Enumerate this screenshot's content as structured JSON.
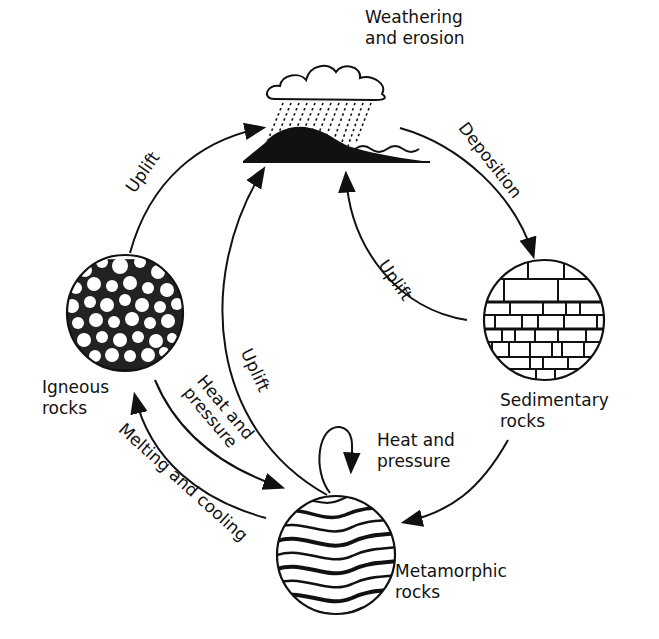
{
  "colors": {
    "ink": "#111111",
    "background": "#ffffff"
  },
  "nodes": {
    "weathering": {
      "line1": "Weathering",
      "line2": "and erosion"
    },
    "igneous": {
      "line1": "Igneous",
      "line2": "rocks"
    },
    "sedimentary": {
      "line1": "Sedimentary",
      "line2": "rocks"
    },
    "metamorphic": {
      "line1": "Metamorphic",
      "line2": "rocks"
    }
  },
  "processes": {
    "uplift_igneous": "Uplift",
    "deposition": "Deposition",
    "uplift_sedimentary": "Uplift",
    "uplift_metamorphic": "Uplift",
    "heat_pressure_igneous": {
      "line1": "Heat and",
      "line2": "pressure"
    },
    "heat_pressure_self": {
      "line1": "Heat and",
      "line2": "pressure"
    },
    "melting_cooling": "Melting and cooling"
  },
  "edges": [
    {
      "from": "Igneous rocks",
      "to": "Weathering and erosion",
      "label": "Uplift"
    },
    {
      "from": "Weathering and erosion",
      "to": "Sedimentary rocks",
      "label": "Deposition"
    },
    {
      "from": "Sedimentary rocks",
      "to": "Weathering and erosion",
      "label": "Uplift"
    },
    {
      "from": "Metamorphic rocks",
      "to": "Weathering and erosion",
      "label": "Uplift"
    },
    {
      "from": "Igneous rocks",
      "to": "Metamorphic rocks",
      "label": "Heat and pressure"
    },
    {
      "from": "Metamorphic rocks",
      "to": "Metamorphic rocks",
      "label": "Heat and pressure"
    },
    {
      "from": "Sedimentary rocks",
      "to": "Metamorphic rocks",
      "label": ""
    },
    {
      "from": "Metamorphic rocks",
      "to": "Igneous rocks",
      "label": "Melting and cooling"
    }
  ]
}
